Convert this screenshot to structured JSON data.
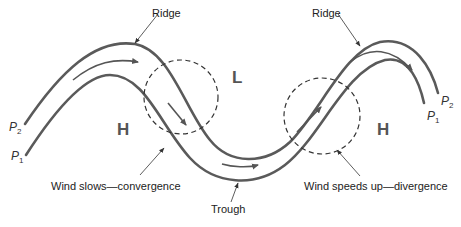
{
  "diagram": {
    "labels": {
      "ridge_left": "Ridge",
      "ridge_right": "Ridge",
      "trough": "Trough",
      "low": "L",
      "high_left": "H",
      "high_right": "H",
      "convergence": "Wind slows—convergence",
      "divergence": "Wind speeds up—divergence"
    },
    "contours": [
      {
        "name": "P",
        "subscript": "2",
        "position": "upper"
      },
      {
        "name": "P",
        "subscript": "1",
        "position": "lower"
      }
    ],
    "colors": {
      "contour": "#5a5a5a",
      "text": "#222222",
      "pressure_letters": "#555555"
    }
  }
}
